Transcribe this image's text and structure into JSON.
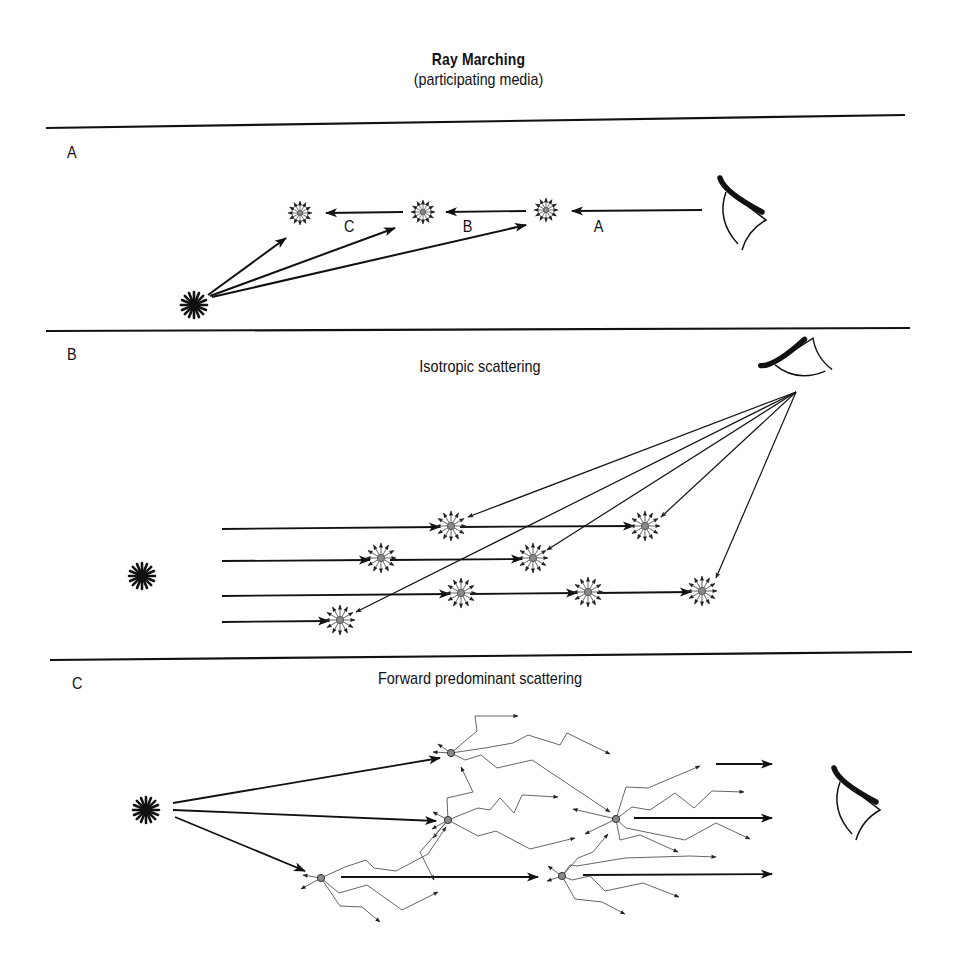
{
  "header": {
    "title": "Ray Marching",
    "subtitle": "(participating media)"
  },
  "colors": {
    "ink": "#111111",
    "scatter_point": "#8a8a8a",
    "scatter_rays": "#555555",
    "background": "#ffffff"
  },
  "dividers": [
    {
      "x1": 46,
      "x2": 905,
      "y1": 128,
      "y2": 115
    },
    {
      "x1": 46,
      "x2": 910,
      "y1": 330,
      "y2": 328
    },
    {
      "x1": 50,
      "x2": 912,
      "y1": 660,
      "y2": 652
    }
  ],
  "panels": [
    {
      "id": "A",
      "label": "A",
      "title": "",
      "step_labels": [
        {
          "text": "C",
          "x": 347,
          "y": 216
        },
        {
          "text": "B",
          "x": 466,
          "y": 216
        },
        {
          "text": "A",
          "x": 597,
          "y": 216
        }
      ],
      "light_source": {
        "x": 194,
        "y": 305
      },
      "eye": {
        "x": 740,
        "y": 200,
        "orientation": "left"
      },
      "scatter_points": [
        {
          "x": 300,
          "y": 213
        },
        {
          "x": 423,
          "y": 212
        },
        {
          "x": 546,
          "y": 210
        }
      ],
      "view_ray": {
        "from": [
          702,
          210
        ],
        "to": [
          557,
          210
        ]
      }
    },
    {
      "id": "B",
      "label": "B",
      "title": "Isotropic scattering",
      "light_source": {
        "x": 142,
        "y": 576
      },
      "eye": {
        "x": 790,
        "y": 365,
        "orientation": "down-left"
      },
      "scatter_points": [
        {
          "x": 451,
          "y": 526
        },
        {
          "x": 645,
          "y": 526
        },
        {
          "x": 381,
          "y": 558
        },
        {
          "x": 533,
          "y": 558
        },
        {
          "x": 461,
          "y": 593
        },
        {
          "x": 588,
          "y": 592
        },
        {
          "x": 702,
          "y": 591
        },
        {
          "x": 340,
          "y": 620
        }
      ],
      "light_rows": [
        525,
        559,
        595,
        621
      ]
    },
    {
      "id": "C",
      "label": "C",
      "title": "Forward predominant scattering",
      "light_source": {
        "x": 146,
        "y": 810
      },
      "eye": {
        "x": 850,
        "y": 800,
        "orientation": "left"
      },
      "scatter_points": [
        {
          "x": 451,
          "y": 753
        },
        {
          "x": 448,
          "y": 820
        },
        {
          "x": 616,
          "y": 819
        },
        {
          "x": 321,
          "y": 878
        },
        {
          "x": 562,
          "y": 876
        }
      ]
    }
  ]
}
